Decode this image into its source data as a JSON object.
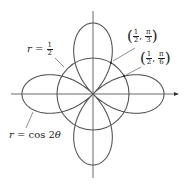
{
  "diagram": {
    "type": "polar-graph",
    "curves": [
      {
        "name": "four-leaved rose",
        "equation_var": "r",
        "equation_rhs": "cos 2",
        "theta": "θ",
        "label": "r = cos 2θ"
      },
      {
        "name": "circle",
        "equation_var": "r",
        "num": "1",
        "den": "2",
        "label": "r = 1/2"
      }
    ],
    "points": [
      {
        "label": "(1/2, π/3)",
        "r_num": "1",
        "r_den": "2",
        "t_num": "π",
        "t_den": "3"
      },
      {
        "label": "(1/2, π/6)",
        "r_num": "1",
        "r_den": "2",
        "t_num": "π",
        "t_den": "6"
      }
    ],
    "colors": {
      "curve": "#555555",
      "axis": "#444444",
      "text": "#222222"
    }
  },
  "labels": {
    "circle_r": "r",
    "circle_eq": "=",
    "circle_num": "1",
    "circle_den": "2",
    "rose_r": "r",
    "rose_eq": "=",
    "rose_rhs": "cos 2",
    "rose_theta": "θ",
    "p1_lp": "(",
    "p1_rnum": "1",
    "p1_rden": "2",
    "p1_comma": ",",
    "p1_tnum": "π",
    "p1_tden": "3",
    "p1_rp": ")",
    "p2_lp": "(",
    "p2_rnum": "1",
    "p2_rden": "2",
    "p2_comma": ",",
    "p2_tnum": "π",
    "p2_tden": "6",
    "p2_rp": ")"
  }
}
